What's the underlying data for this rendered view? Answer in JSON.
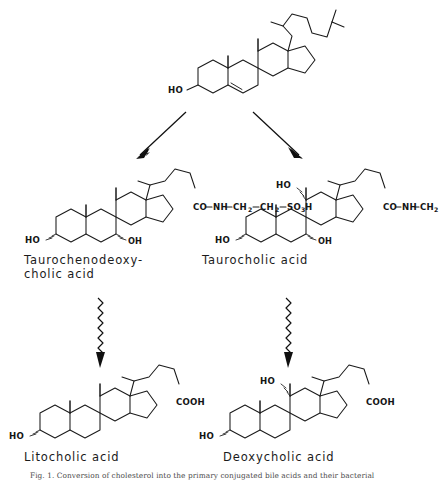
{
  "figure": {
    "type": "biochemical-pathway-diagram",
    "caption": "Fig. 1. Conversion of cholesterol into the primary conjugated bile acids and their bacterial",
    "background_color": "#ffffff",
    "line_color": "#1a1a1a"
  },
  "nodes": {
    "cholesterol": {
      "label": "",
      "hydroxyls": [
        "HO"
      ],
      "features": "steroid nucleus with C5-C6 double bond and isooctyl side chain",
      "atom_labels": {
        "c3_hydroxyl": "HO"
      }
    },
    "taurochenodeoxycholic_acid": {
      "label": "Taurochenodeoxy-\ncholic acid",
      "atom_labels": {
        "c3_hydroxyl": "HO",
        "c7_hydroxyl": "OH",
        "side_chain_co": "CO",
        "side_chain_nh": "NH",
        "side_chain_ch2_a": "CH",
        "side_chain_ch2_a_sub": "2",
        "side_chain_ch2_b": "CH",
        "side_chain_ch2_b_sub": "2",
        "side_chain_so3h": "SO",
        "side_chain_so3h_sub": "3",
        "side_chain_so3h_tail": "H"
      }
    },
    "taurocholic_acid": {
      "label": "Taurocholic acid",
      "atom_labels": {
        "c3_hydroxyl": "HO",
        "c7_hydroxyl": "OH",
        "c12_hydroxyl": "HO",
        "side_chain_co": "CO",
        "side_chain_nh": "NH",
        "side_chain_ch2_a": "CH",
        "side_chain_ch2_a_sub": "2",
        "side_chain_ch2_b": "CH",
        "side_chain_ch2_b_sub": "2",
        "side_chain_so3h": "SO",
        "side_chain_so3h_sub": "3",
        "side_chain_so3h_tail": "H"
      }
    },
    "litocholic_acid": {
      "label": "Litocholic acid",
      "atom_labels": {
        "c3_hydroxyl": "HO",
        "side_chain_cooh": "COOH"
      }
    },
    "deoxycholic_acid": {
      "label": "Deoxycholic acid",
      "atom_labels": {
        "c3_hydroxyl": "HO",
        "c12_hydroxyl": "HO",
        "side_chain_cooh": "COOH"
      }
    }
  },
  "arrows": [
    {
      "name": "cholesterol-to-taurochenodeoxycholic",
      "style": "straight",
      "direction": "down-left"
    },
    {
      "name": "cholesterol-to-taurocholic",
      "style": "straight",
      "direction": "down-right"
    },
    {
      "name": "taurochenodeoxycholic-to-litocholic",
      "style": "wavy",
      "direction": "down"
    },
    {
      "name": "taurocholic-to-deoxycholic",
      "style": "wavy",
      "direction": "down"
    }
  ]
}
